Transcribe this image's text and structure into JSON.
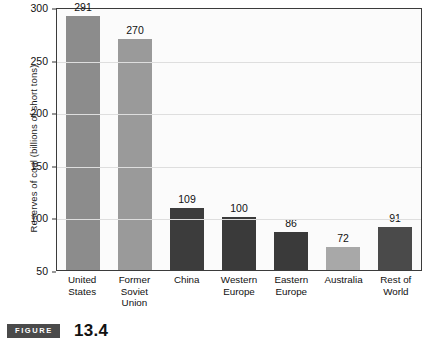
{
  "caption": {
    "badge_label": "FIGURE",
    "number": "13.4"
  },
  "chart_data": {
    "type": "bar",
    "title": "",
    "xlabel": "",
    "ylabel": "Reserves of coal (billions of short tons)",
    "ylim": [
      50,
      300
    ],
    "yticks": [
      50,
      100,
      150,
      200,
      250,
      300
    ],
    "ytick_labels": [
      "50",
      "100",
      "150",
      "200",
      "250",
      "300"
    ],
    "grid": true,
    "legend": "none",
    "categories": [
      "United States",
      "Former Soviet Union",
      "China",
      "Western Europe",
      "Eastern Europe",
      "Australia",
      "Rest of World"
    ],
    "category_lines": [
      [
        "United",
        "States"
      ],
      [
        "Former",
        "Soviet",
        "Union"
      ],
      [
        "China"
      ],
      [
        "Western",
        "Europe"
      ],
      [
        "Eastern",
        "Europe"
      ],
      [
        "Australia"
      ],
      [
        "Rest of",
        "World"
      ]
    ],
    "values": [
      291,
      270,
      109,
      100,
      86,
      72,
      91
    ],
    "value_labels": [
      "291",
      "270",
      "109",
      "100",
      "86",
      "72",
      "91"
    ],
    "bar_colors": [
      "#8c8c8c",
      "#9a9a9a",
      "#3c3c3c",
      "#3a3a3a",
      "#3a3a3a",
      "#a8a8a8",
      "#4a4a4a"
    ]
  },
  "colors": {
    "plot_background": "#fbfbfb",
    "plot_border": "#3b3b3b",
    "gridline": "#dedede",
    "text": "#111111",
    "badge_background": "#4a4a4a",
    "badge_text": "#ffffff"
  }
}
